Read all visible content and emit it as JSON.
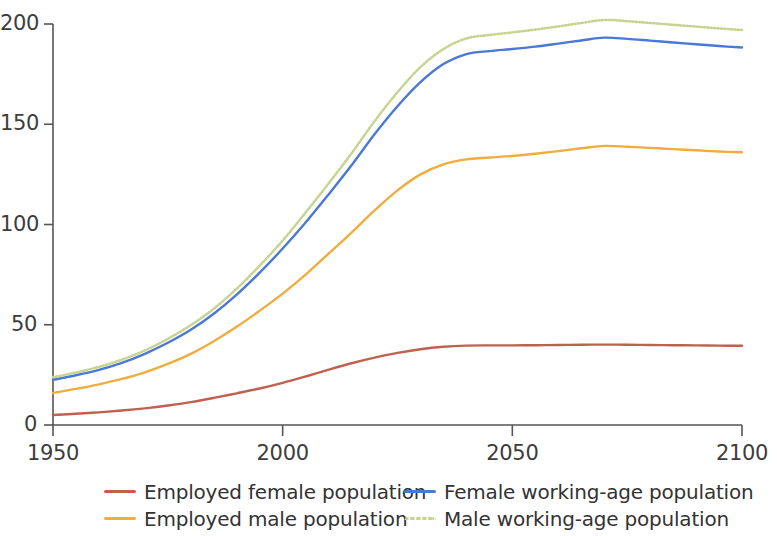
{
  "chart_data": {
    "type": "line",
    "title": "",
    "subtitle": "",
    "xlabel": "",
    "ylabel": "",
    "xlim": [
      1950,
      2100
    ],
    "ylim": [
      0,
      200
    ],
    "grid": false,
    "legend_position": "bottom",
    "x_ticks": [
      "1950",
      "2000",
      "2050",
      "2100"
    ],
    "x_tick_values": [
      1950,
      2000,
      2050,
      2100
    ],
    "y_ticks": [
      "0",
      "50",
      "100",
      "150",
      "200"
    ],
    "y_tick_values": [
      0,
      50,
      100,
      150,
      200
    ],
    "x": [
      1950,
      1955,
      1960,
      1965,
      1970,
      1975,
      1980,
      1985,
      1990,
      1995,
      2000,
      2005,
      2010,
      2015,
      2020,
      2025,
      2030,
      2035,
      2040,
      2045,
      2050,
      2055,
      2060,
      2065,
      2070,
      2075,
      2080,
      2085,
      2090,
      2095,
      2100
    ],
    "series": [
      {
        "name": "Employed female population",
        "color": "#c0614f",
        "style": "solid",
        "values": [
          5.0,
          5.6,
          6.3,
          7.2,
          8.3,
          9.7,
          11.4,
          13.5,
          15.8,
          18.2,
          21.0,
          24.2,
          27.6,
          30.8,
          33.6,
          36.0,
          37.8,
          39.0,
          39.6,
          39.7,
          39.7,
          39.8,
          39.9,
          40.0,
          40.1,
          40.0,
          39.9,
          39.8,
          39.7,
          39.6,
          39.5
        ]
      },
      {
        "name": "Employed male population",
        "color": "#f0ad3e",
        "style": "solid",
        "values": [
          16.0,
          18.0,
          20.3,
          23.0,
          26.3,
          30.5,
          35.5,
          41.8,
          49.0,
          57.0,
          65.5,
          75.0,
          85.5,
          96.0,
          107.0,
          117.0,
          125.0,
          130.0,
          132.5,
          133.4,
          134.2,
          135.3,
          136.6,
          138.0,
          139.2,
          138.8,
          138.2,
          137.6,
          137.0,
          136.4,
          136.0
        ]
      },
      {
        "name": "Female working-age population",
        "color": "#4a78d6",
        "style": "solid",
        "values": [
          22.5,
          24.8,
          27.5,
          31.0,
          35.5,
          41.0,
          47.5,
          55.5,
          65.0,
          76.0,
          88.0,
          101.0,
          115.0,
          129.5,
          145.0,
          159.0,
          171.0,
          180.0,
          185.0,
          186.5,
          187.5,
          188.7,
          190.2,
          191.8,
          193.2,
          192.6,
          191.7,
          190.8,
          189.9,
          189.0,
          188.3
        ]
      },
      {
        "name": "Male working-age population",
        "color": "#c6d490",
        "style": "dotted",
        "values": [
          23.8,
          26.2,
          29.0,
          32.6,
          37.2,
          43.0,
          49.8,
          58.0,
          68.0,
          79.5,
          92.0,
          106.0,
          120.5,
          135.5,
          151.5,
          166.0,
          178.5,
          187.5,
          192.8,
          194.5,
          195.8,
          197.2,
          198.8,
          200.5,
          202.0,
          201.4,
          200.5,
          199.6,
          198.7,
          197.8,
          197.0
        ]
      }
    ]
  },
  "axes": {
    "axis_color": "#555555",
    "background": "#ffffff"
  },
  "legend": {
    "items": [
      {
        "label": "Employed female population",
        "color": "#c0614f",
        "style": "solid"
      },
      {
        "label": "Female working-age population",
        "color": "#4a78d6",
        "style": "solid"
      },
      {
        "label": "Employed male population",
        "color": "#f0ad3e",
        "style": "solid"
      },
      {
        "label": "Male working-age population",
        "color": "#c6d490",
        "style": "dotted"
      }
    ]
  }
}
